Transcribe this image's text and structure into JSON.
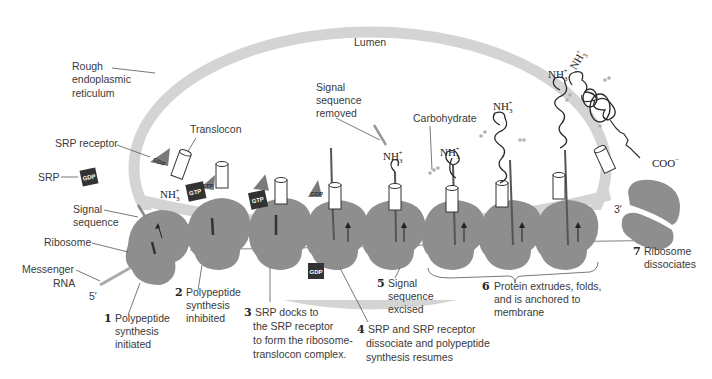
{
  "figure": {
    "compartments": {
      "lumen": "Lumen",
      "er": [
        "Rough",
        "endoplasmic",
        "reticulum"
      ]
    },
    "component_labels": {
      "translocon": "Translocon",
      "srp_receptor": "SRP receptor",
      "srp": "SRP",
      "signal_sequence": [
        "Signal",
        "sequence"
      ],
      "ribosome": "Ribosome",
      "mrna": [
        "Messenger",
        "RNA"
      ],
      "five_prime": "5′",
      "three_prime": "3′",
      "signal_removed": [
        "Signal",
        "sequence",
        "removed"
      ],
      "carbohydrate": "Carbohydrate",
      "amino_terminus": "NH",
      "amino_sub": "3",
      "amino_sup": "+",
      "carboxy_terminus": "COO",
      "carboxy_sup": "−"
    },
    "nucleotide_tags": {
      "gdp": "GDP",
      "gtp": "GTP"
    },
    "steps": [
      {
        "number": "1",
        "lines": [
          "Polypeptide",
          "synthesis",
          "initiated"
        ]
      },
      {
        "number": "2",
        "lines": [
          "Polypeptide",
          "synthesis",
          "inhibited"
        ]
      },
      {
        "number": "3",
        "lines": [
          "SRP docks to",
          "the SRP receptor",
          "to form the ribosome-",
          "translocon complex."
        ]
      },
      {
        "number": "4",
        "lines": [
          "SRP and SRP receptor",
          "dissociate and polypeptide",
          "synthesis resumes"
        ]
      },
      {
        "number": "5",
        "lines": [
          "Signal",
          "sequence",
          "excised"
        ]
      },
      {
        "number": "6",
        "lines": [
          "Protein extrudes, folds,",
          "and is anchored to",
          "membrane"
        ]
      },
      {
        "number": "7",
        "lines": [
          "Ribosome",
          "dissociates"
        ]
      }
    ],
    "colors": {
      "membrane": "#d4d4d4",
      "ribosome": "#8e8e8e",
      "srp_tag": "#3a3a3a",
      "receptor": "#7a7a7a",
      "text": "#3a3a3a"
    }
  }
}
